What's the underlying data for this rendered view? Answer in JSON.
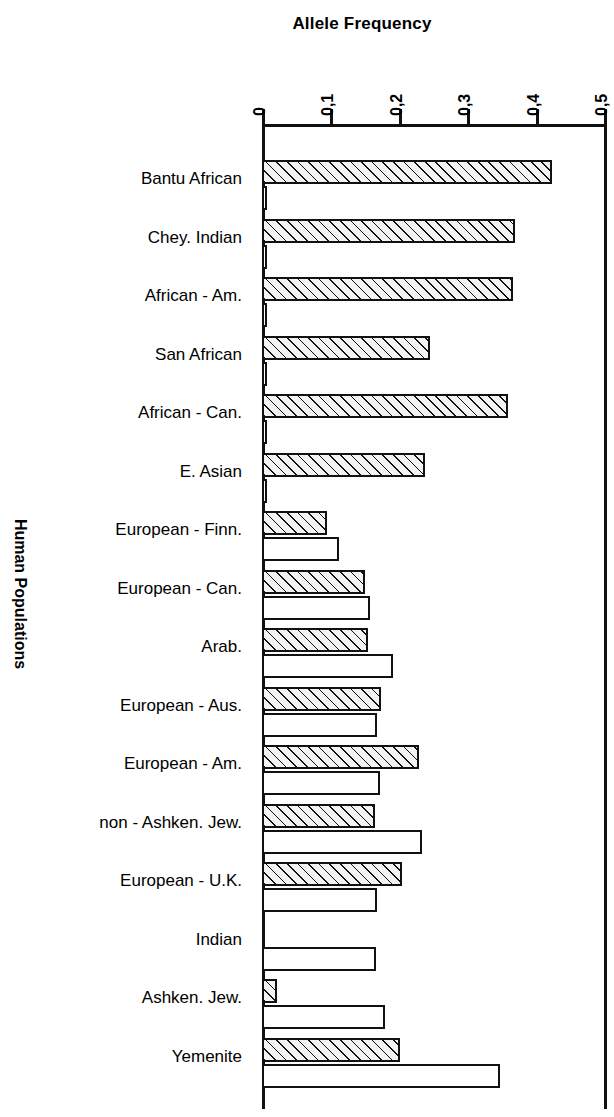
{
  "chart_data": {
    "type": "bar",
    "orientation": "horizontal",
    "title": "Allele Frequency",
    "xlabel": "Allele Frequency",
    "ylabel": "Human Populations",
    "xlim": [
      0,
      0.5
    ],
    "grid": false,
    "legend": "none",
    "decimal_separator": ",",
    "xticks": [
      "0",
      "0,1",
      "0,2",
      "0,3",
      "0,4",
      "0,5"
    ],
    "xtick_values": [
      0,
      0.1,
      0.2,
      0.3,
      0.4,
      0.5
    ],
    "categories": [
      "Bantu African",
      "Chey. Indian",
      "African - Am.",
      "San African",
      "African - Can.",
      "E. Asian",
      "European - Finn.",
      "European - Can.",
      "Arab.",
      "European - Aus.",
      "European - Am.",
      "non - Ashken. Jew.",
      "European - U.K.",
      "Indian",
      "Ashken. Jew.",
      "Yemenite"
    ],
    "series": [
      {
        "name": "hatched",
        "style": "diagonal-hatch",
        "values": [
          0.424,
          0.37,
          0.367,
          0.246,
          0.36,
          0.238,
          0.095,
          0.151,
          0.155,
          0.174,
          0.229,
          0.165,
          0.204,
          0.0,
          0.022,
          0.202
        ]
      },
      {
        "name": "open",
        "style": "white-fill",
        "values": [
          0.008,
          0.008,
          0.008,
          0.008,
          0.008,
          0.008,
          0.113,
          0.158,
          0.192,
          0.168,
          0.172,
          0.234,
          0.168,
          0.167,
          0.18,
          0.348
        ]
      }
    ]
  },
  "colors": {
    "axis": "#111111",
    "bar_outline": "#111111",
    "hatch_fill": "#f3f3f3",
    "open_fill": "#ffffff",
    "background": "#ffffff"
  }
}
